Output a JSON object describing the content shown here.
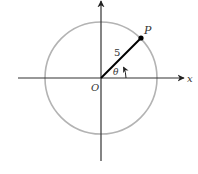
{
  "diagram": {
    "type": "unit-circle-angle",
    "labels": {
      "origin": "O",
      "point": "P",
      "x_axis": "x",
      "radius": "5",
      "angle": "θ"
    },
    "colors": {
      "circle": "#b3b3b3",
      "axes": "#333333",
      "segment": "#000000"
    }
  }
}
